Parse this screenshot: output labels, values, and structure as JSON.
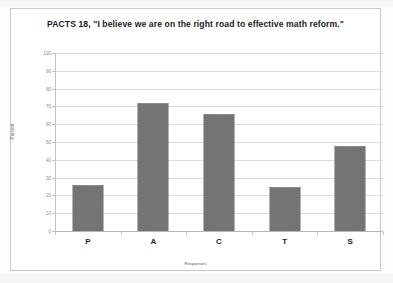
{
  "chart_data": {
    "type": "bar",
    "title": "PACTS 18, \"I believe we are on the right road to effective math reform.\"",
    "xlabel": "Responses",
    "ylabel": "Percent",
    "categories": [
      "P",
      "A",
      "C",
      "T",
      "S"
    ],
    "values": [
      26,
      72,
      66,
      25,
      48
    ],
    "ylim": [
      0,
      100
    ],
    "yticks": [
      100,
      90,
      80,
      70,
      60,
      50,
      40,
      30,
      20,
      10,
      0
    ],
    "grid": true,
    "legend": "none",
    "series_color": "#6f6f6f"
  },
  "axis": {
    "y_label": "Percent",
    "x_label": "Responses",
    "ticks": {
      "t100": "100",
      "t90": "90",
      "t80": "80",
      "t70": "70",
      "t60": "60",
      "t50": "50",
      "t40": "40",
      "t30": "30",
      "t20": "20",
      "t10": "10",
      "t0": "0"
    }
  },
  "bars": [
    {
      "label": "P",
      "value": 26
    },
    {
      "label": "A",
      "value": 72
    },
    {
      "label": "C",
      "value": 66
    },
    {
      "label": "T",
      "value": 25
    },
    {
      "label": "S",
      "value": 48
    }
  ]
}
